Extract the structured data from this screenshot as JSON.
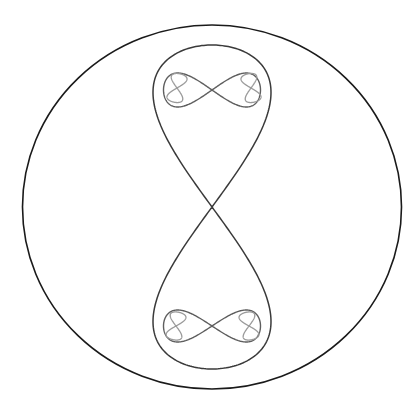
{
  "diagram": {
    "background": "#ffffff",
    "outer_circle": {
      "cx": 212,
      "cy": 207,
      "rx": 189.5,
      "ry": 182,
      "stroke": "#1a1a1a",
      "stroke_width": 1.6
    },
    "curves": [
      {
        "id": "level-1-vertical-eight",
        "orientation": "vertical",
        "cx": 212,
        "cy": 207,
        "a": 118,
        "b": 162,
        "stroke": "#3a3a3a",
        "stroke_width": 1.5
      },
      {
        "id": "level-2-horizontal-eight-top",
        "orientation": "horizontal",
        "cx": 212,
        "cy": 90,
        "a": 48.5,
        "b": 34,
        "stroke": "#5e5e5e",
        "stroke_width": 1.4
      },
      {
        "id": "level-2-horizontal-eight-bottom",
        "orientation": "horizontal",
        "cx": 212,
        "cy": 326,
        "a": 48.5,
        "b": 32,
        "stroke": "#5e5e5e",
        "stroke_width": 1.4
      },
      {
        "id": "level-3-vertical-eight-top-left",
        "orientation": "vertical",
        "cx": 177,
        "cy": 88,
        "a": 16,
        "b": 14.5,
        "tilt": 12,
        "stroke": "#9a9a9a",
        "stroke_width": 1.3
      },
      {
        "id": "level-3-vertical-eight-top-right",
        "orientation": "vertical",
        "cx": 251,
        "cy": 88,
        "a": 16,
        "b": 14.5,
        "tilt": -12,
        "stroke": "#9a9a9a",
        "stroke_width": 1.3
      },
      {
        "id": "level-3-vertical-eight-bottom-left",
        "orientation": "vertical",
        "cx": 176,
        "cy": 326,
        "a": 16,
        "b": 14,
        "tilt": 12,
        "stroke": "#9a9a9a",
        "stroke_width": 1.3
      },
      {
        "id": "level-3-vertical-eight-bottom-right",
        "orientation": "vertical",
        "cx": 249,
        "cy": 326,
        "a": 16,
        "b": 14,
        "tilt": -12,
        "stroke": "#9a9a9a",
        "stroke_width": 1.3
      }
    ]
  }
}
